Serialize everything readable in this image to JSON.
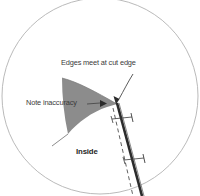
{
  "figure": {
    "name": "cut-edge-joint-diagram",
    "annotations": {
      "edges_meet": "Edges meet at cut edge",
      "note_inaccuracy": "Note inaccuracy",
      "inside": "Inside"
    },
    "colors": {
      "circle_outline": "#b0b0b0",
      "shaded_region": "#8a8a8a",
      "thick_edge_line": "#2b2b2b",
      "dashed_line": "#555555",
      "leader_line": "#4a4a4a",
      "text": "#3a3a3a",
      "background": "#ffffff"
    },
    "elements": {
      "circle_label": "viewing-circle",
      "shaded_label": "shaded-gap-region",
      "thick_line_label": "cut-edge-line",
      "dashed_line_label": "reference-dashed-line",
      "tick_upper_label": "caliper-tick-upper",
      "tick_lower_label": "caliper-tick-lower",
      "arrow_apex_label": "leader-arrow-to-apex",
      "arrow_gap_label": "leader-arrow-to-gap"
    }
  }
}
